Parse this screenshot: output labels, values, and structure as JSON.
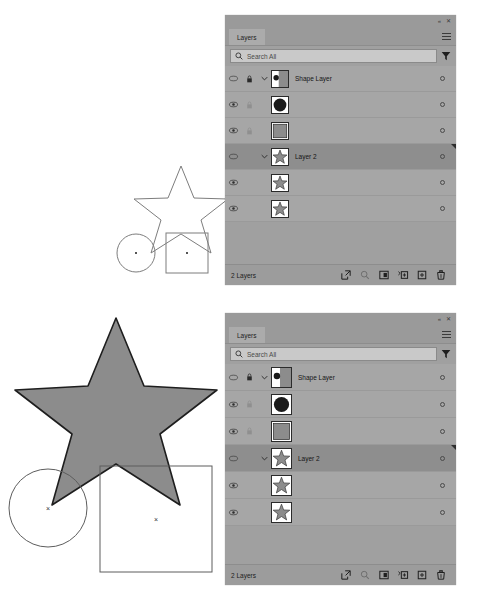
{
  "app": {
    "panel_title": "Layers",
    "window_collapse_icon": "double-chevron-left-icon",
    "window_close_icon": "close-icon",
    "panel_menu_icon": "hamburger-menu-icon"
  },
  "search": {
    "placeholder": "Search All",
    "search_icon": "search-icon",
    "filter_icon": "filter-funnel-icon"
  },
  "layers": [
    {
      "name": "Shape Layer",
      "visible": true,
      "locked": true,
      "lock_dim": false,
      "has_twisty": true,
      "expanded": true,
      "indent": 0,
      "selected": false,
      "thumb": "shape-layer-thumb"
    },
    {
      "name": "<Ellipse>",
      "visible": true,
      "locked": true,
      "lock_dim": true,
      "has_twisty": false,
      "expanded": false,
      "indent": 1,
      "selected": false,
      "thumb": "ellipse-thumb"
    },
    {
      "name": "<Rectangle>",
      "visible": true,
      "locked": true,
      "lock_dim": true,
      "has_twisty": false,
      "expanded": false,
      "indent": 1,
      "selected": false,
      "thumb": "rectangle-thumb"
    },
    {
      "name": "Layer 2",
      "visible": true,
      "locked": false,
      "lock_dim": false,
      "has_twisty": true,
      "expanded": true,
      "indent": 0,
      "selected": true,
      "thumb": "star-thumb"
    },
    {
      "name": "<Path>",
      "visible": true,
      "locked": false,
      "lock_dim": false,
      "has_twisty": false,
      "expanded": false,
      "indent": 1,
      "selected": false,
      "thumb": "star-thumb"
    },
    {
      "name": "<Path>",
      "visible": true,
      "locked": false,
      "lock_dim": false,
      "has_twisty": false,
      "expanded": false,
      "indent": 1,
      "selected": false,
      "thumb": "star-thumb"
    }
  ],
  "footer": {
    "count_label": "2 Layers",
    "icons": [
      "link-layers-icon",
      "search-layers-icon",
      "add-mask-icon",
      "add-adjustment-icon",
      "new-layer-icon",
      "delete-layer-icon"
    ]
  },
  "colors": {
    "panel_background": "#a0a0a0",
    "row_background": "#a6a6a6",
    "row_selected": "#8e8e8e",
    "tab_background": "#ababab",
    "footer_background": "#9c9c9c",
    "search_field": "#c9c9c9",
    "artwork_fill": "#8c8c8c",
    "artwork_stroke": "#1e1e1e",
    "outline_stroke": "#6a6a6a"
  },
  "artwork": {
    "top_star": "star-outline",
    "top_circle": "circle-outline",
    "top_square": "square-outline",
    "bottom_star": "star-filled",
    "bottom_circle": "circle-outline",
    "bottom_square": "square-outline",
    "anchor_marker": "center-anchor-point"
  }
}
